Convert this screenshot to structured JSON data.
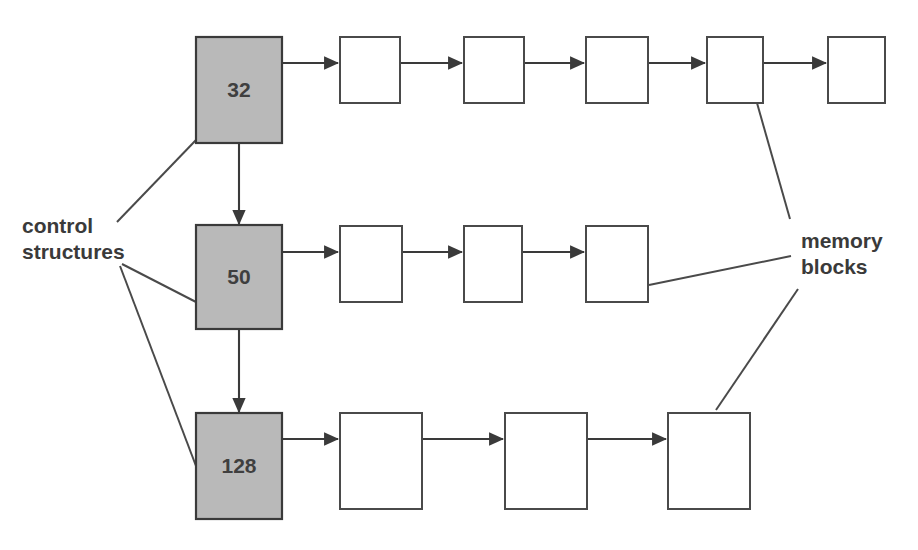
{
  "diagram": {
    "colors": {
      "control_box_fill": "#b9b9b9",
      "control_box_stroke": "#3a3a3a",
      "memory_box_fill": "#ffffff",
      "memory_box_stroke": "#4a4a4a",
      "line": "#3a3a3a",
      "text": "#3a3a3a",
      "background": "#ffffff"
    },
    "annotations": {
      "left": {
        "line1": "control",
        "line2": "structures"
      },
      "right": {
        "line1": "memory",
        "line2": "blocks"
      }
    },
    "control_structures": [
      {
        "id": "ctrl-32",
        "label": "32",
        "x": 196,
        "y": 37,
        "width": 86,
        "height": 106,
        "memory_block_count": 5
      },
      {
        "id": "ctrl-50",
        "label": "50",
        "x": 196,
        "y": 225,
        "width": 86,
        "height": 104,
        "memory_block_count": 3
      },
      {
        "id": "ctrl-128",
        "label": "128",
        "x": 196,
        "y": 413,
        "width": 86,
        "height": 106,
        "memory_block_count": 3
      }
    ],
    "memory_rows": [
      {
        "row_id": "memory-row-32",
        "blocks": [
          {
            "x": 340,
            "y": 37,
            "width": 60,
            "height": 66
          },
          {
            "x": 464,
            "y": 37,
            "width": 60,
            "height": 66
          },
          {
            "x": 586,
            "y": 37,
            "width": 62,
            "height": 66
          },
          {
            "x": 707,
            "y": 37,
            "width": 56,
            "height": 66
          },
          {
            "x": 828,
            "y": 37,
            "width": 57,
            "height": 66
          }
        ]
      },
      {
        "row_id": "memory-row-50",
        "blocks": [
          {
            "x": 340,
            "y": 226,
            "width": 62,
            "height": 76
          },
          {
            "x": 464,
            "y": 226,
            "width": 58,
            "height": 76
          },
          {
            "x": 586,
            "y": 226,
            "width": 62,
            "height": 76
          }
        ]
      },
      {
        "row_id": "memory-row-128",
        "blocks": [
          {
            "x": 340,
            "y": 413,
            "width": 82,
            "height": 96
          },
          {
            "x": 505,
            "y": 413,
            "width": 82,
            "height": 96
          },
          {
            "x": 668,
            "y": 413,
            "width": 82,
            "height": 96
          }
        ]
      }
    ],
    "vertical_links": [
      {
        "from": "ctrl-32",
        "to": "ctrl-50",
        "x": 239,
        "y1": 143,
        "y2": 225
      },
      {
        "from": "ctrl-50",
        "to": "ctrl-128",
        "x": 239,
        "y1": 329,
        "y2": 413
      }
    ],
    "leader_lines": [
      {
        "name": "control-structures-to-32",
        "x1": 117,
        "y1": 222,
        "x2": 196,
        "y2": 140
      },
      {
        "name": "control-structures-to-50",
        "x1": 122,
        "y1": 264,
        "x2": 196,
        "y2": 302
      },
      {
        "name": "control-structures-to-128",
        "x1": 120,
        "y1": 266,
        "x2": 196,
        "y2": 466
      },
      {
        "name": "memory-blocks-to-top-row",
        "x1": 757,
        "y1": 103,
        "x2": 790,
        "y2": 219
      },
      {
        "name": "memory-blocks-to-mid-row",
        "x1": 649,
        "y1": 285,
        "x2": 791,
        "y2": 256
      },
      {
        "name": "memory-blocks-to-bot-row",
        "x1": 716,
        "y1": 410,
        "x2": 798,
        "y2": 289
      }
    ]
  }
}
